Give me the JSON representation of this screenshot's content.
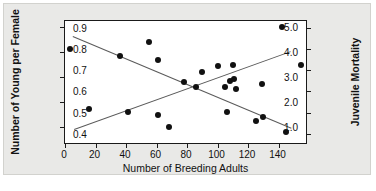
{
  "chart_data": {
    "type": "scatter",
    "title": "",
    "xlabel": "Number of Breeding Adults",
    "ylabel": "Number of Young per Female",
    "ylabel_right": "Juvenile Mortality",
    "xlim": [
      0,
      158
    ],
    "ylim": [
      0.35,
      5.25
    ],
    "ylim_right": [
      0.355,
      0.935
    ],
    "grid": false,
    "legend": "none",
    "xticks": [
      0,
      20,
      40,
      60,
      80,
      100,
      120,
      140
    ],
    "xticklabels": [
      "0",
      "20",
      "40",
      "60",
      "80",
      "100",
      "120",
      "140"
    ],
    "yticks_left": [
      1.0,
      2.0,
      3.0,
      4.0,
      5.0
    ],
    "yticklabels_left": [
      "1.0",
      "2.0",
      "3.0",
      "4.0",
      "5.0"
    ],
    "yticks_right": [
      0.4,
      0.5,
      0.6,
      0.7,
      0.8,
      0.9
    ],
    "yticklabels_right": [
      "0.4",
      "0.5",
      "0.6",
      "0.7",
      "0.8",
      "0.9"
    ],
    "series": [
      {
        "name": "Number of Young per Female",
        "axis": "left",
        "marker": "filled-circle",
        "color": "#111111",
        "points": [
          {
            "x": 3,
            "y": 4.13
          },
          {
            "x": 16,
            "y": 1.7
          },
          {
            "x": 36,
            "y": 3.83
          },
          {
            "x": 41,
            "y": 1.58
          },
          {
            "x": 55,
            "y": 4.4
          },
          {
            "x": 61,
            "y": 3.68
          },
          {
            "x": 61,
            "y": 1.48
          },
          {
            "x": 68,
            "y": 1.0
          },
          {
            "x": 78,
            "y": 2.78
          },
          {
            "x": 86,
            "y": 2.58
          },
          {
            "x": 90,
            "y": 3.22
          },
          {
            "x": 100,
            "y": 3.45
          },
          {
            "x": 105,
            "y": 2.58
          },
          {
            "x": 106,
            "y": 1.58
          },
          {
            "x": 108,
            "y": 2.85
          },
          {
            "x": 110,
            "y": 3.47
          },
          {
            "x": 111,
            "y": 2.93
          },
          {
            "x": 112,
            "y": 2.52
          },
          {
            "x": 125,
            "y": 1.23
          },
          {
            "x": 129,
            "y": 2.72
          },
          {
            "x": 130,
            "y": 1.4
          },
          {
            "x": 142,
            "y": 5.0
          },
          {
            "x": 145,
            "y": 0.78
          },
          {
            "x": 155,
            "y": 3.5
          }
        ]
      }
    ],
    "trendlines": [
      {
        "name": "young-per-female-trend",
        "axis": "left",
        "color": "#5a5a5a",
        "x1": 5,
        "y1": 4.66,
        "x2": 148,
        "y2": 0.98
      },
      {
        "name": "juvenile-mortality-trend",
        "axis": "left",
        "color": "#5a5a5a",
        "x1": 6,
        "y1": 0.92,
        "x2": 148,
        "y2": 4.05
      }
    ]
  }
}
